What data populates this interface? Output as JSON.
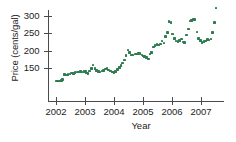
{
  "chart_data": {
    "type": "scatter",
    "title": "",
    "xlabel": "Year",
    "ylabel": "Price (cents/gal)",
    "xlim": [
      2001.82,
      2007.55
    ],
    "ylim": [
      103,
      330
    ],
    "grid": false,
    "legend": null,
    "marker_color": "#2e7d52",
    "marker_shape": "square",
    "axis_color": "#4a4a4a",
    "xticks": [
      2002,
      2003,
      2004,
      2005,
      2006,
      2007
    ],
    "xtick_labels": [
      "2002",
      "2003",
      "2004",
      "2005",
      "2006",
      "2007"
    ],
    "yticks": [
      150,
      200,
      250,
      300
    ],
    "ytick_labels": [
      "150",
      "200",
      "250",
      "300"
    ],
    "points": [
      [
        2002.02,
        112
      ],
      [
        2002.06,
        112
      ],
      [
        2002.1,
        113
      ],
      [
        2002.14,
        113
      ],
      [
        2002.19,
        114
      ],
      [
        2002.23,
        116
      ],
      [
        2002.3,
        131
      ],
      [
        2002.36,
        130
      ],
      [
        2002.42,
        132
      ],
      [
        2002.48,
        133
      ],
      [
        2002.54,
        135
      ],
      [
        2002.6,
        134
      ],
      [
        2002.66,
        137
      ],
      [
        2002.72,
        139
      ],
      [
        2002.78,
        138
      ],
      [
        2002.84,
        140
      ],
      [
        2002.9,
        139
      ],
      [
        2002.96,
        140
      ],
      [
        2003.02,
        140
      ],
      [
        2003.06,
        135
      ],
      [
        2003.1,
        134
      ],
      [
        2003.16,
        141
      ],
      [
        2003.22,
        149
      ],
      [
        2003.28,
        159
      ],
      [
        2003.34,
        148
      ],
      [
        2003.4,
        143
      ],
      [
        2003.46,
        140
      ],
      [
        2003.52,
        139
      ],
      [
        2003.58,
        141
      ],
      [
        2003.64,
        143
      ],
      [
        2003.7,
        147
      ],
      [
        2003.76,
        148
      ],
      [
        2003.82,
        144
      ],
      [
        2003.88,
        141
      ],
      [
        2003.94,
        138
      ],
      [
        2004.0,
        137
      ],
      [
        2004.06,
        140
      ],
      [
        2004.12,
        146
      ],
      [
        2004.18,
        152
      ],
      [
        2004.24,
        158
      ],
      [
        2004.3,
        164
      ],
      [
        2004.36,
        173
      ],
      [
        2004.42,
        186
      ],
      [
        2004.48,
        202
      ],
      [
        2004.54,
        194
      ],
      [
        2004.6,
        188
      ],
      [
        2004.66,
        187
      ],
      [
        2004.72,
        190
      ],
      [
        2004.78,
        190
      ],
      [
        2004.84,
        192
      ],
      [
        2004.9,
        191
      ],
      [
        2004.96,
        188
      ],
      [
        2005.02,
        185
      ],
      [
        2005.06,
        183
      ],
      [
        2005.12,
        180
      ],
      [
        2005.18,
        176
      ],
      [
        2005.24,
        190
      ],
      [
        2005.3,
        194
      ],
      [
        2005.36,
        210
      ],
      [
        2005.42,
        215
      ],
      [
        2005.48,
        218
      ],
      [
        2005.54,
        216
      ],
      [
        2005.6,
        219
      ],
      [
        2005.66,
        228
      ],
      [
        2005.72,
        222
      ],
      [
        2005.78,
        241
      ],
      [
        2005.84,
        252
      ],
      [
        2005.9,
        284
      ],
      [
        2005.96,
        282
      ],
      [
        2006.02,
        248
      ],
      [
        2006.08,
        235
      ],
      [
        2006.14,
        228
      ],
      [
        2006.2,
        226
      ],
      [
        2006.26,
        230
      ],
      [
        2006.32,
        234
      ],
      [
        2006.38,
        225
      ],
      [
        2006.44,
        224
      ],
      [
        2006.5,
        245
      ],
      [
        2006.56,
        263
      ],
      [
        2006.62,
        285
      ],
      [
        2006.68,
        287
      ],
      [
        2006.74,
        290
      ],
      [
        2006.8,
        290
      ],
      [
        2006.86,
        254
      ],
      [
        2006.92,
        235
      ],
      [
        2006.98,
        229
      ],
      [
        2007.04,
        224
      ],
      [
        2007.1,
        226
      ],
      [
        2007.16,
        228
      ],
      [
        2007.22,
        232
      ],
      [
        2007.28,
        231
      ],
      [
        2007.34,
        234
      ],
      [
        2007.4,
        253
      ],
      [
        2007.46,
        281
      ],
      [
        2007.52,
        323
      ]
    ]
  }
}
